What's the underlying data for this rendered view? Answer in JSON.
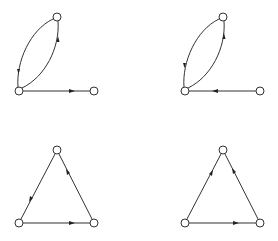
{
  "diagram": {
    "type": "directed-graphs",
    "colors": {
      "stroke": "#333333",
      "node_fill": "#ffffff",
      "arrow": "#222222",
      "background": "#ffffff"
    },
    "graphs": [
      {
        "id": "top-left",
        "nodes": [
          {
            "id": "a",
            "x": 57,
            "y": 17
          },
          {
            "id": "b",
            "x": 19,
            "y": 91
          },
          {
            "id": "c",
            "x": 94,
            "y": 91
          }
        ],
        "edges": [
          {
            "from": "a",
            "to": "b",
            "curve": "left"
          },
          {
            "from": "b",
            "to": "a",
            "curve": "right"
          },
          {
            "from": "b",
            "to": "c",
            "curve": "straight"
          }
        ]
      },
      {
        "id": "top-right",
        "nodes": [
          {
            "id": "a",
            "x": 223,
            "y": 17
          },
          {
            "id": "b",
            "x": 185,
            "y": 91
          },
          {
            "id": "c",
            "x": 260,
            "y": 91
          }
        ],
        "edges": [
          {
            "from": "a",
            "to": "b",
            "curve": "left"
          },
          {
            "from": "b",
            "to": "a",
            "curve": "right"
          },
          {
            "from": "c",
            "to": "b",
            "curve": "straight"
          }
        ]
      },
      {
        "id": "bottom-left",
        "nodes": [
          {
            "id": "a",
            "x": 57,
            "y": 150
          },
          {
            "id": "b",
            "x": 19,
            "y": 223
          },
          {
            "id": "c",
            "x": 94,
            "y": 223
          }
        ],
        "edges": [
          {
            "from": "a",
            "to": "b"
          },
          {
            "from": "b",
            "to": "c"
          },
          {
            "from": "c",
            "to": "a"
          }
        ]
      },
      {
        "id": "bottom-right",
        "nodes": [
          {
            "id": "a",
            "x": 223,
            "y": 150
          },
          {
            "id": "b",
            "x": 185,
            "y": 223
          },
          {
            "id": "c",
            "x": 260,
            "y": 223
          }
        ],
        "edges": [
          {
            "from": "b",
            "to": "a"
          },
          {
            "from": "b",
            "to": "c"
          },
          {
            "from": "c",
            "to": "a"
          }
        ]
      }
    ]
  }
}
